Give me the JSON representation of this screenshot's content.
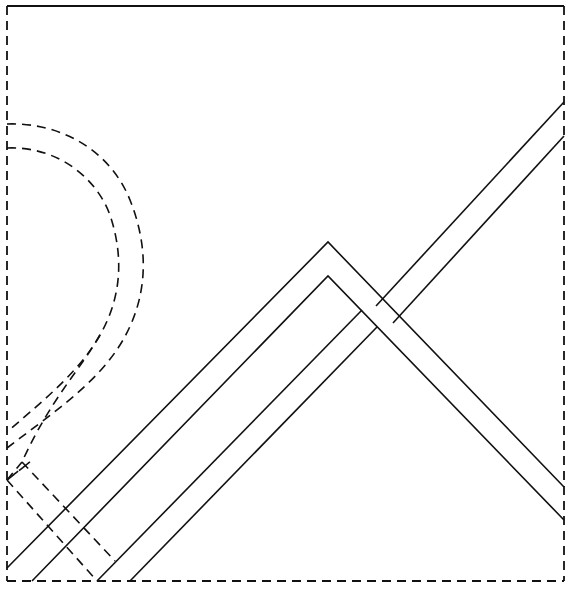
{
  "diagram": {
    "type": "line-drawing",
    "colors": {
      "stroke": "#111111",
      "background": "#ffffff"
    },
    "frame": {
      "top": "solid",
      "left": "dashed",
      "right": "dashed",
      "bottom": "dashed"
    },
    "elements": [
      {
        "name": "bent-strip",
        "style": "solid",
        "apex": [
          328,
          242
        ]
      },
      {
        "name": "straight-strip",
        "style": "solid",
        "direction": "up-right"
      },
      {
        "name": "curved-strip",
        "style": "dashed",
        "hidden": true
      }
    ]
  }
}
